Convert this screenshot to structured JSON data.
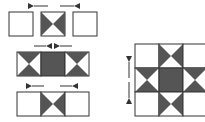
{
  "colors": {
    "dark": "#555555",
    "line": "#333333",
    "light": "#ffffff"
  },
  "diagram": {
    "rows": [
      {
        "name": "top-row",
        "cells": [
          "plain",
          "hourglass-vertical",
          "plain"
        ],
        "arrows": [
          "left",
          "right"
        ]
      },
      {
        "name": "middle-row",
        "cells": [
          "hourglass-horizontal",
          "solid",
          "hourglass-horizontal"
        ],
        "arrows": [
          "right",
          "left"
        ]
      },
      {
        "name": "bottom-row",
        "cells": [
          "plain",
          "hourglass-vertical",
          "plain"
        ],
        "arrows": [
          "left",
          "right"
        ]
      }
    ],
    "assembled_block": {
      "grid": "3x3",
      "arrows": [
        "up",
        "down"
      ]
    }
  }
}
